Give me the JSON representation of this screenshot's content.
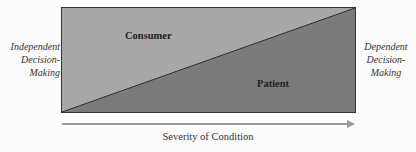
{
  "diagram": {
    "left_label": [
      "Independent",
      "Decision-",
      "Making"
    ],
    "right_label": [
      "Dependent",
      "Decision-",
      "Making"
    ],
    "regions": {
      "consumer": {
        "label": "Consumer",
        "color": "#a6a6a6"
      },
      "patient": {
        "label": "Patient",
        "color": "#7a7a7a"
      }
    },
    "axis": {
      "label": "Severity of Condition",
      "arrow_color": "#9a9a9a"
    },
    "border_color": "#333333"
  }
}
